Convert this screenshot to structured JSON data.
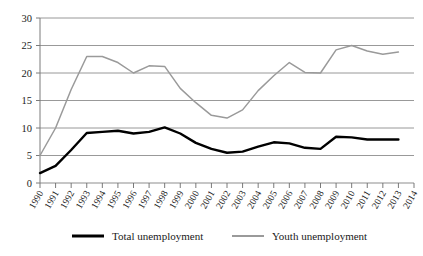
{
  "chart_data": {
    "type": "line",
    "title": "",
    "subtitle": "",
    "xlabel": "",
    "ylabel": "",
    "xlim": [
      1990,
      2014
    ],
    "ylim": [
      0,
      30
    ],
    "ytick_step": 5,
    "grid": true,
    "grid_axis": "y",
    "legend_position": "bottom",
    "x": [
      1990,
      1991,
      1992,
      1993,
      1994,
      1995,
      1996,
      1997,
      1998,
      1999,
      2000,
      2001,
      2002,
      2003,
      2004,
      2005,
      2006,
      2007,
      2008,
      2009,
      2010,
      2011,
      2012,
      2013,
      2014
    ],
    "categories": [
      "1990",
      "1991",
      "1992",
      "1993",
      "1994",
      "1995",
      "1996",
      "1997",
      "1998",
      "1999",
      "2000",
      "2001",
      "2002",
      "2003",
      "2004",
      "2005",
      "2006",
      "2007",
      "2008",
      "2009",
      "2010",
      "2011",
      "2012",
      "2013",
      "2014"
    ],
    "xtick_labels": [
      "1990",
      "1991",
      "1992",
      "1993",
      "1994",
      "1995",
      "1996",
      "1997",
      "1998",
      "1999",
      "2000",
      "2001",
      "2002",
      "2003",
      "2004",
      "2005",
      "2006",
      "2007",
      "2008",
      "2009",
      "2010",
      "2011",
      "2012",
      "2013",
      "2014"
    ],
    "ytick_labels": [
      "0",
      "5",
      "10",
      "15",
      "20",
      "25",
      "30"
    ],
    "ytick_values": [
      0,
      5,
      10,
      15,
      20,
      25,
      30
    ],
    "series": [
      {
        "name": "Total unemployment",
        "color": "#000000",
        "width": 2.4,
        "values": [
          1.8,
          3.1,
          6.0,
          9.1,
          9.3,
          9.5,
          9.0,
          9.3,
          10.1,
          9.0,
          7.3,
          6.2,
          5.5,
          5.7,
          6.6,
          7.4,
          7.2,
          6.4,
          6.2,
          8.4,
          8.3,
          7.9,
          7.9,
          7.9,
          null
        ]
      },
      {
        "name": "Youth unemployment",
        "color": "#9a9a9a",
        "width": 1.5,
        "values": [
          5.0,
          10.0,
          17.0,
          23.0,
          23.0,
          21.9,
          20.0,
          21.3,
          21.2,
          17.2,
          14.6,
          12.3,
          11.8,
          13.3,
          16.8,
          19.5,
          21.9,
          20.1,
          20.0,
          24.2,
          25.0,
          24.0,
          23.4,
          23.8,
          null
        ]
      }
    ],
    "legend": [
      {
        "label": "Total unemployment",
        "color": "#000000",
        "width": 3
      },
      {
        "label": "Youth unemployment",
        "color": "#9a9a9a",
        "width": 2
      }
    ]
  }
}
